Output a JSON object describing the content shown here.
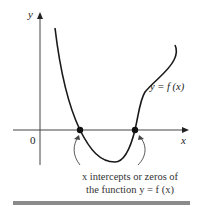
{
  "figure": {
    "axes": {
      "y_label": "y",
      "x_label": "x",
      "origin_label": "0"
    },
    "curve_label": "y = f (x)",
    "caption": {
      "line1": "x intercepts or zeros of",
      "line2": "the function y = f (x)"
    },
    "intercepts": [
      {
        "name": "first-zero",
        "x_px": 80,
        "y_px": 130
      },
      {
        "name": "second-zero",
        "x_px": 135,
        "y_px": 130
      }
    ],
    "colors": {
      "curve": "#1a1a1a",
      "axes": "#333333",
      "bar": "#8a8a8a"
    }
  }
}
